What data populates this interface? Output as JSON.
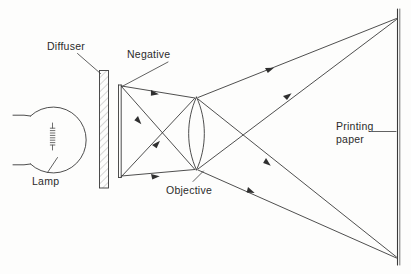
{
  "figure": {
    "type": "optical-ray-diagram",
    "background_color": "#fdfdfc",
    "ink_color": "#3a3a3a",
    "text_color": "#2b2b2b"
  },
  "labels": {
    "diffuser": "Diffuser",
    "negative": "Negative",
    "lamp": "Lamp",
    "objective": "Objective",
    "printing_paper_line1": "Printing",
    "printing_paper_line2": "paper"
  },
  "components": [
    {
      "name": "lamp",
      "label": "Lamp",
      "shape": "circle-bulb-with-filament"
    },
    {
      "name": "diffuser",
      "label": "Diffuser",
      "shape": "hatched-plate"
    },
    {
      "name": "negative",
      "label": "Negative",
      "shape": "thin-plate"
    },
    {
      "name": "objective",
      "label": "Objective",
      "shape": "biconvex-lens"
    },
    {
      "name": "printing-paper",
      "label": "Printing paper",
      "shape": "vertical-plane"
    }
  ],
  "rays": {
    "count": 8,
    "arrowheads": 7,
    "description": "Rays leave the negative top and bottom edges, converge through the objective lens, cross, and diverge to the printing paper forming an inverted image."
  }
}
